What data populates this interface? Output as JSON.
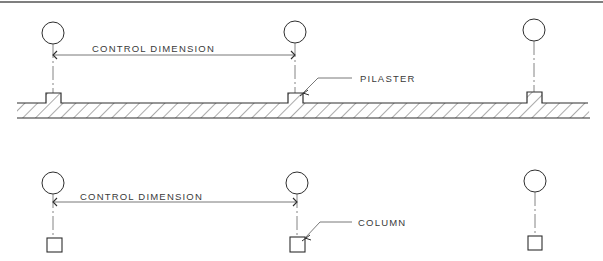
{
  "diagram": {
    "type": "architectural-plan-detail",
    "panels": [
      {
        "id": "pilaster-wall",
        "dimension_label": "CONTROL DIMENSION",
        "callout_label": "PILASTER",
        "grid_markers": 3,
        "element": "pilaster"
      },
      {
        "id": "columns",
        "dimension_label": "CONTROL DIMENSION",
        "callout_label": "COLUMN",
        "grid_markers": 3,
        "element": "column"
      }
    ],
    "colors": {
      "ink": "#2e2e2e",
      "background": "#ffffff"
    }
  }
}
